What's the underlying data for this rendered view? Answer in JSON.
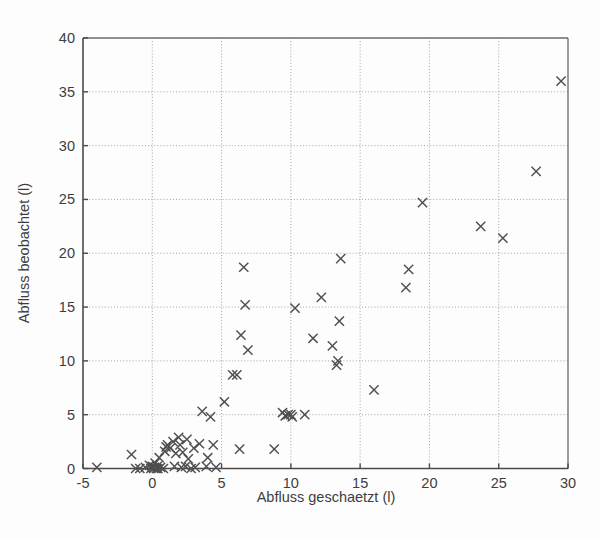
{
  "figure": {
    "background_color": "#fdfdfd",
    "marker_color": "#4f4f4f",
    "axis_color": "#4a4a4a",
    "grid_color": "#9a9a9a",
    "marker_symbol": "x-cross-marker"
  },
  "caption": {
    "text": "",
    "visible": false
  },
  "chart_data": {
    "type": "scatter",
    "title": "",
    "subtitle": "",
    "xlabel": "Abfluss geschaetzt (l)",
    "ylabel": "Abfluss beobachtet (l)",
    "xlim": [
      -5,
      30
    ],
    "ylim": [
      0,
      40
    ],
    "xticks": [
      -5,
      0,
      5,
      10,
      15,
      20,
      25,
      30
    ],
    "xticklabels": [
      "-5",
      "0",
      "5",
      "10",
      "15",
      "20",
      "25",
      "30"
    ],
    "yticks": [
      0,
      5,
      10,
      15,
      20,
      25,
      30,
      35,
      40
    ],
    "yticklabels": [
      "0",
      "5",
      "10",
      "15",
      "20",
      "25",
      "30",
      "35",
      "40"
    ],
    "grid": true,
    "grid_style": "dotted",
    "legend": null,
    "legend_position": "none",
    "marker": "x",
    "series": [
      {
        "name": "Abfluss",
        "points": [
          [
            -4.0,
            0.1
          ],
          [
            -1.5,
            1.3
          ],
          [
            -1.2,
            0.0
          ],
          [
            -0.9,
            0.0
          ],
          [
            -0.5,
            0.1
          ],
          [
            -0.2,
            0.3
          ],
          [
            -0.1,
            0.0
          ],
          [
            0.0,
            0.2
          ],
          [
            0.1,
            0.0
          ],
          [
            0.15,
            0.1
          ],
          [
            0.2,
            0.5
          ],
          [
            0.3,
            0.0
          ],
          [
            0.35,
            0.2
          ],
          [
            0.4,
            0.0
          ],
          [
            0.5,
            1.0
          ],
          [
            0.6,
            0.1
          ],
          [
            0.8,
            0.0
          ],
          [
            0.9,
            1.6
          ],
          [
            1.0,
            2.0
          ],
          [
            1.1,
            2.2
          ],
          [
            1.3,
            1.9
          ],
          [
            1.5,
            2.5
          ],
          [
            1.6,
            0.2
          ],
          [
            1.7,
            1.4
          ],
          [
            1.9,
            2.9
          ],
          [
            2.0,
            2.2
          ],
          [
            2.1,
            0.1
          ],
          [
            2.2,
            1.5
          ],
          [
            2.4,
            0.2
          ],
          [
            2.5,
            2.7
          ],
          [
            2.6,
            0.9
          ],
          [
            2.8,
            0.0
          ],
          [
            3.0,
            1.9
          ],
          [
            3.1,
            0.1
          ],
          [
            3.4,
            2.3
          ],
          [
            3.6,
            5.3
          ],
          [
            3.9,
            0.2
          ],
          [
            4.0,
            1.0
          ],
          [
            4.2,
            4.8
          ],
          [
            4.4,
            2.2
          ],
          [
            4.6,
            0.1
          ],
          [
            5.2,
            6.2
          ],
          [
            5.8,
            8.7
          ],
          [
            6.1,
            8.7
          ],
          [
            6.3,
            1.8
          ],
          [
            6.4,
            12.4
          ],
          [
            6.6,
            18.7
          ],
          [
            6.7,
            15.2
          ],
          [
            6.9,
            11.0
          ],
          [
            8.8,
            1.8
          ],
          [
            9.4,
            5.2
          ],
          [
            9.6,
            4.9
          ],
          [
            9.8,
            5.0
          ],
          [
            10.0,
            5.0
          ],
          [
            10.1,
            4.8
          ],
          [
            10.3,
            14.9
          ],
          [
            11.0,
            5.0
          ],
          [
            11.6,
            12.1
          ],
          [
            12.2,
            15.9
          ],
          [
            13.0,
            11.4
          ],
          [
            13.3,
            9.6
          ],
          [
            13.4,
            10.0
          ],
          [
            13.5,
            13.7
          ],
          [
            13.6,
            19.5
          ],
          [
            16.0,
            7.3
          ],
          [
            18.3,
            16.8
          ],
          [
            18.5,
            18.5
          ],
          [
            19.5,
            24.7
          ],
          [
            23.7,
            22.5
          ],
          [
            25.3,
            21.4
          ],
          [
            27.7,
            27.6
          ],
          [
            29.5,
            36.0
          ]
        ]
      }
    ]
  }
}
